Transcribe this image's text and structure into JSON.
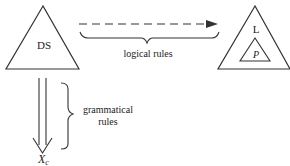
{
  "diagram": {
    "left_node": {
      "label": "DS"
    },
    "right_node": {
      "outer_label": "L",
      "inner_label": "P"
    },
    "horizontal_arrow": {
      "style": "dashed",
      "brace_label": "logical rules"
    },
    "vertical_arrow": {
      "style": "double",
      "brace_label_line1": "grammatical",
      "brace_label_line2": "rules"
    },
    "bottom_node": {
      "label": "X",
      "subscript": "c"
    }
  }
}
